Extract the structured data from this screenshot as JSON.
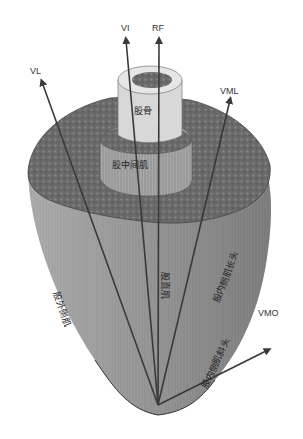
{
  "arrows": [
    {
      "id": "VL",
      "label": "VL"
    },
    {
      "id": "VI",
      "label": "VI"
    },
    {
      "id": "RF",
      "label": "RF"
    },
    {
      "id": "VML",
      "label": "VML"
    },
    {
      "id": "VMO",
      "label": "VMO"
    }
  ],
  "structures": {
    "femur": "股骨",
    "vastus_intermedius": "股中间肌",
    "vastus_lateralis": "股外侧肌",
    "rectus_femoris": "股直肌",
    "vastus_medialis_longus": "股内侧肌长头",
    "vastus_medialis_obliquus": "股内侧肌斜头"
  },
  "colors": {
    "arrow": "#3a3a3a",
    "muscle_section": "#6e6e6e",
    "muscle_body": "#9a9a9a",
    "bone": "#dcdcdc"
  }
}
